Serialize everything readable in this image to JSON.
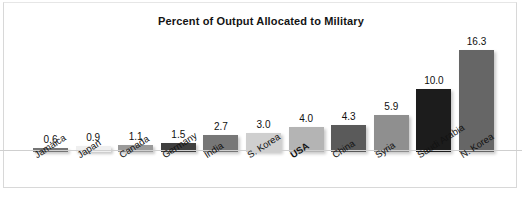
{
  "chart_data": {
    "type": "bar",
    "title": "Percent of Output Allocated to Military",
    "xlabel": "",
    "ylabel": "",
    "ylim": [
      0,
      16.3
    ],
    "grid": false,
    "legend": null,
    "value_labels_shown": true,
    "categories": [
      "Jamaica",
      "Japan",
      "Canada",
      "Germany",
      "India",
      "S. Korea",
      "USA",
      "China",
      "Syria",
      "Saudi Arabia",
      "N. Korea"
    ],
    "values": [
      0.6,
      0.9,
      1.1,
      1.5,
      2.7,
      3.0,
      4.0,
      4.3,
      5.9,
      10.0,
      16.3
    ],
    "value_label_text": [
      "0.6",
      "0.9",
      "1.1",
      "1.5",
      "2.7",
      "3.0",
      "4.0",
      "4.3",
      "5.9",
      "10.0",
      "16.3"
    ],
    "bar_colors": [
      "#757575",
      "#efefef",
      "#9a9a9a",
      "#3f3f3f",
      "#777777",
      "#cfcfcf",
      "#b4b4b4",
      "#5a5a5a",
      "#8f8f8f",
      "#1c1c1c",
      "#666666"
    ],
    "highlighted_category": "USA"
  },
  "colors": {
    "background": "#ffffff",
    "text": "#111111",
    "frame": "#d8d8d8",
    "baseline": "#cfcfcf"
  }
}
